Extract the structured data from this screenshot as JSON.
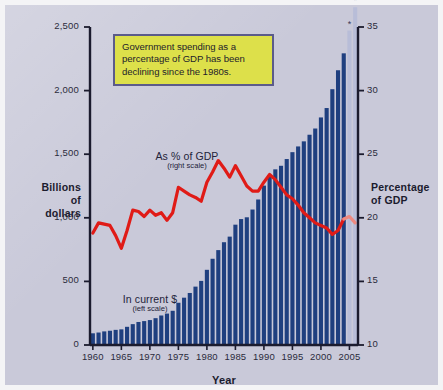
{
  "callout": {
    "text": "Government spending as a percentage of GDP has been declining since the 1980s."
  },
  "labels": {
    "y_left": "Billions\nof\ndollars",
    "y_left_lines": [
      "Billions",
      "of",
      "dollars"
    ],
    "y_right_lines": [
      "Percentage",
      "of GDP"
    ],
    "x_title": "Year",
    "series_bars": "In current $",
    "series_bars_note": "(left scale)",
    "series_line": "As % of GDP",
    "series_line_note": "(right scale)"
  },
  "colors": {
    "background": "#c9c9d9",
    "bar": "#1f3f7f",
    "bar_projected": "#b8bdd8",
    "line": "#e01b17",
    "line_projected": "#ef8a80",
    "callout_fill": "#dde04a",
    "callout_border": "#5b5b8a",
    "axis": "#1b1b2e",
    "text": "#2b2b3c"
  },
  "chart_data": {
    "type": "bar",
    "title": "",
    "xlabel": "Year",
    "grid": false,
    "legend": "inline-annotations",
    "x": [
      1960,
      1961,
      1962,
      1963,
      1964,
      1965,
      1966,
      1967,
      1968,
      1969,
      1970,
      1971,
      1972,
      1973,
      1974,
      1975,
      1976,
      1977,
      1978,
      1979,
      1980,
      1981,
      1982,
      1983,
      1984,
      1985,
      1986,
      1987,
      1988,
      1989,
      1990,
      1991,
      1992,
      1993,
      1994,
      1995,
      1996,
      1997,
      1998,
      1999,
      2000,
      2001,
      2002,
      2003,
      2004,
      2005,
      2006
    ],
    "xtick_labels": [
      "1960",
      "1965",
      "1970",
      "1975",
      "1980",
      "1985",
      "1990",
      "1995",
      "2000",
      "2005"
    ],
    "xticks": [
      1960,
      1965,
      1970,
      1975,
      1980,
      1985,
      1990,
      1995,
      2000,
      2005
    ],
    "projected_from": 2005,
    "projection_marker": "*",
    "series": [
      {
        "name": "In current $",
        "note": "(left scale)",
        "type": "bar",
        "axis": "left",
        "ylabel": "Billions of dollars",
        "ylim": [
          0,
          2500
        ],
        "yticks": [
          0,
          500,
          1000,
          1500,
          2000,
          2500
        ],
        "ytick_labels": [
          "0",
          "500",
          "1,000",
          "1,500",
          "2,000",
          "2,500"
        ],
        "color": "#1f3f7f",
        "projected_color": "#b8bdd8",
        "values": [
          92,
          98,
          107,
          112,
          119,
          123,
          143,
          164,
          181,
          188,
          196,
          211,
          232,
          247,
          269,
          332,
          372,
          409,
          459,
          504,
          591,
          678,
          746,
          808,
          852,
          946,
          990,
          1004,
          1065,
          1144,
          1253,
          1325,
          1381,
          1409,
          1462,
          1516,
          1561,
          1601,
          1653,
          1702,
          1789,
          1863,
          2011,
          2160,
          2293,
          2472,
          2655
        ]
      },
      {
        "name": "As % of GDP",
        "note": "(right scale)",
        "type": "line",
        "axis": "right",
        "ylabel": "Percentage of GDP",
        "ylim": [
          10,
          35
        ],
        "yticks": [
          10,
          15,
          20,
          25,
          30,
          35
        ],
        "ytick_labels": [
          "10",
          "15",
          "20",
          "25",
          "30",
          "35"
        ],
        "color": "#e01b17",
        "projected_color": "#ef8a80",
        "values": [
          18.8,
          19.6,
          19.5,
          19.4,
          18.6,
          17.6,
          19.0,
          20.6,
          20.5,
          20.1,
          20.6,
          20.2,
          20.4,
          19.8,
          20.4,
          22.4,
          22.1,
          21.8,
          21.6,
          21.3,
          22.8,
          23.6,
          24.5,
          23.9,
          23.2,
          24.1,
          23.3,
          22.5,
          22.1,
          22.1,
          22.8,
          23.4,
          23.0,
          22.4,
          21.8,
          21.5,
          21.0,
          20.4,
          20.0,
          19.6,
          19.4,
          19.2,
          18.7,
          19.0,
          19.9,
          20.1,
          19.6
        ]
      }
    ]
  }
}
